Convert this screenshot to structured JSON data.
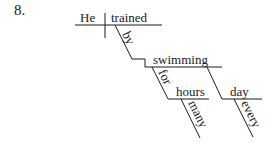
{
  "problem_number": "8.",
  "diagram": {
    "type": "sentence-diagram",
    "sentence_words": {
      "subject": "He",
      "verb": "trained",
      "preposition_1": "by",
      "gerund": "swimming",
      "preposition_2": "for",
      "object_2": "hours",
      "modifier_2": "many",
      "adverbial_noun": "day",
      "modifier_3": "every"
    }
  }
}
